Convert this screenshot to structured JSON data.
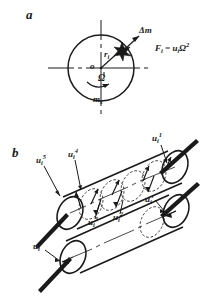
{
  "figure": {
    "background_color": "#ffffff",
    "ink_color": "#1a1a1a"
  },
  "panel_a": {
    "letter": "a",
    "center_label": "o",
    "radius_label": "r",
    "radius_sub": "i",
    "point_mass_label": "Δm",
    "angular_velocity_label": "Ω",
    "rotor_mass_label": "m",
    "rotor_mass_sub": "s",
    "formula": {
      "force_symbol": "F",
      "force_sub": "i",
      "equals": "=",
      "unbalance_symbol": "u",
      "unbalance_sub": "i",
      "omega_symbol": "Ω",
      "omega_exp": "2",
      "full_text": "F i = u i Ω 2"
    }
  },
  "panel_b": {
    "letter": "b",
    "distributed_unbalance_vectors": [
      {
        "symbol": "u",
        "sub": "i",
        "sup": "1"
      },
      {
        "symbol": "u",
        "sub": "i",
        "sup": "2"
      },
      {
        "symbol": "u",
        "sub": "i",
        "sup": "3"
      },
      {
        "symbol": "u",
        "sub": "i",
        "sup": "4"
      },
      {
        "symbol": "u",
        "sub": "i",
        "sup": "5"
      }
    ],
    "equivalent_unbalance_vectors": [
      {
        "symbol": "u",
        "sub": "i",
        "sup": "l"
      },
      {
        "symbol": "u",
        "sub": "i",
        "sup": "r"
      }
    ]
  }
}
